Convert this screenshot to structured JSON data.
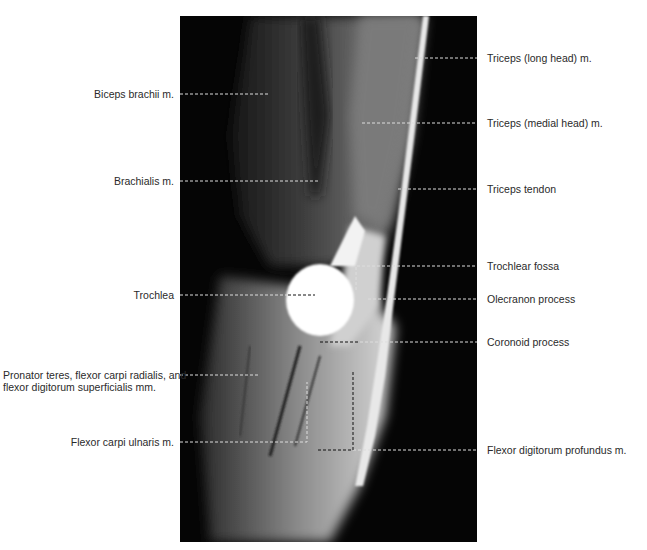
{
  "figure": {
    "type": "sagittal MRI of elbow",
    "left_labels": [
      {
        "text": "Biceps brachii m.",
        "y": 94
      },
      {
        "text": "Brachialis m.",
        "y": 181
      },
      {
        "text": "Trochlea",
        "y": 295
      },
      {
        "text": "Pronator teres, flexor carpi radialis, and flexor digitorum superficialis mm.",
        "y": 375
      },
      {
        "text": "Flexor carpi ulnaris m.",
        "y": 442
      }
    ],
    "right_labels": [
      {
        "text": "Triceps (long head) m.",
        "y": 58
      },
      {
        "text": "Triceps (medial head) m.",
        "y": 123
      },
      {
        "text": "Triceps tendon",
        "y": 189
      },
      {
        "text": "Trochlear fossa",
        "y": 266
      },
      {
        "text": "Olecranon process",
        "y": 299
      },
      {
        "text": "Coronoid process",
        "y": 342
      },
      {
        "text": "Flexor digitorum profundus m.",
        "y": 450
      }
    ]
  }
}
